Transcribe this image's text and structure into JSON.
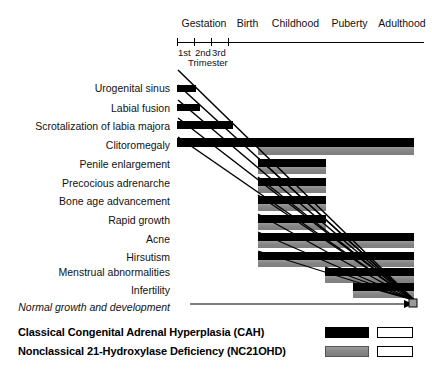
{
  "chart_data": {
    "type": "bar",
    "xlabel": "",
    "ylabel": "",
    "orientation": "horizontal",
    "grid": false,
    "legend_position": "bottom",
    "timeline_periods": [
      {
        "label": "Gestation",
        "x_px": 178,
        "width_px": 52
      },
      {
        "label": "Birth",
        "x_px": 231,
        "width_px": 33
      },
      {
        "label": "Childhood",
        "x_px": 266,
        "width_px": 59
      },
      {
        "label": "Puberty",
        "x_px": 327,
        "width_px": 45
      },
      {
        "label": "Adulthood",
        "x_px": 374,
        "width_px": 56
      }
    ],
    "axis": {
      "start_px": 177,
      "end_px": 424,
      "ticks_px": [
        177,
        194,
        211,
        228
      ],
      "tick_labels": [
        "1st",
        "2nd",
        "3rd"
      ],
      "tick_group_label": "Trimester"
    },
    "series": [
      {
        "name": "Classical Congenital Adrenal Hyperplasia (CAH)",
        "key": "cah",
        "color": "#000000",
        "swatch": "solid-black"
      },
      {
        "name": "Nonclassical 21-Hydroxylase Deficiency (NC21OHD)",
        "key": "nc",
        "color": "#8c8c8c",
        "swatch": "solid-gray"
      }
    ],
    "categories": [
      "Urogenital sinus",
      "Labial fusion",
      "Scrotalization of labia majora",
      "Clitoromegaly",
      "Penile enlargement",
      "Precocious adrenarche",
      "Bone age advancement",
      "Rapid growth",
      "Acne",
      "Hirsutism",
      "Menstrual abnormalities",
      "Infertility",
      "Normal growth and development"
    ],
    "rows": [
      {
        "label": "Urogenital sinus",
        "italic": false,
        "label_y": 88,
        "cah": {
          "x": 177,
          "w": 19,
          "y": 85,
          "h": 7
        },
        "nc": null
      },
      {
        "label": "Labial fusion",
        "italic": false,
        "label_y": 108,
        "cah": {
          "x": 177,
          "w": 23,
          "y": 104,
          "h": 7
        },
        "nc": null
      },
      {
        "label": "Scrotalization of labia majora",
        "italic": false,
        "label_y": 126,
        "cah": {
          "x": 177,
          "w": 56,
          "y": 121,
          "h": 8
        },
        "nc": null
      },
      {
        "label": "Clitoromegaly",
        "italic": false,
        "label_y": 145,
        "cah": {
          "x": 177,
          "w": 237,
          "y": 138,
          "h": 9
        },
        "nc": {
          "x": 258,
          "w": 156,
          "y": 147,
          "h": 8
        }
      },
      {
        "label": "Penile enlargement",
        "italic": false,
        "label_y": 164,
        "cah": {
          "x": 258,
          "w": 68,
          "y": 159,
          "h": 8
        },
        "nc": {
          "x": 258,
          "w": 68,
          "y": 167,
          "h": 7
        }
      },
      {
        "label": "Precocious adrenarche",
        "italic": false,
        "label_y": 183,
        "cah": {
          "x": 258,
          "w": 68,
          "y": 178,
          "h": 8
        },
        "nc": {
          "x": 258,
          "w": 68,
          "y": 186,
          "h": 7
        }
      },
      {
        "label": "Bone age advancement",
        "italic": false,
        "label_y": 201,
        "cah": {
          "x": 258,
          "w": 68,
          "y": 196,
          "h": 8
        },
        "nc": {
          "x": 258,
          "w": 68,
          "y": 204,
          "h": 7
        }
      },
      {
        "label": "Rapid growth",
        "italic": false,
        "label_y": 220,
        "cah": {
          "x": 258,
          "w": 68,
          "y": 215,
          "h": 8
        },
        "nc": {
          "x": 258,
          "w": 68,
          "y": 223,
          "h": 7
        }
      },
      {
        "label": "Acne",
        "italic": false,
        "label_y": 239,
        "cah": {
          "x": 258,
          "w": 156,
          "y": 233,
          "h": 8
        },
        "nc": {
          "x": 258,
          "w": 156,
          "y": 241,
          "h": 7
        }
      },
      {
        "label": "Hirsutism",
        "italic": false,
        "label_y": 257,
        "cah": {
          "x": 258,
          "w": 156,
          "y": 252,
          "h": 8
        },
        "nc": {
          "x": 258,
          "w": 156,
          "y": 260,
          "h": 7
        }
      },
      {
        "label": "Menstrual abnormalities",
        "italic": false,
        "label_y": 272,
        "cah": {
          "x": 325,
          "w": 89,
          "y": 268,
          "h": 8
        },
        "nc": {
          "x": 325,
          "w": 89,
          "y": 276,
          "h": 7
        }
      },
      {
        "label": "Infertility",
        "italic": false,
        "label_y": 290,
        "cah": {
          "x": 353,
          "w": 61,
          "y": 283,
          "h": 8
        },
        "nc": {
          "x": 353,
          "w": 61,
          "y": 291,
          "h": 7
        }
      },
      {
        "label": "Normal growth and development",
        "italic": true,
        "label_y": 307,
        "cah": null,
        "nc": null
      }
    ],
    "normal_growth_arrow": {
      "x1": 190,
      "x2": 413,
      "y": 304
    },
    "annotations": [
      "Diagonal convergence lines run from the start of gestation to the adulthood end point",
      "Arrowhead converges at the right-hand adulthood terminus"
    ]
  },
  "legend": {
    "rows": [
      {
        "label": "Classical Congenital Adrenal Hyperplasia (CAH)",
        "swatch": "cah"
      },
      {
        "label": "Nonclassical 21-Hydroxylase Deficiency (NC21OHD)",
        "swatch": "nc"
      }
    ],
    "cah_color": "#000000",
    "nc_color": "#8c8c8c",
    "open_color": "#ffffff"
  }
}
